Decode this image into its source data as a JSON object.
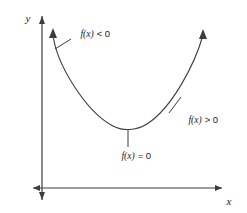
{
  "figure": {
    "background_color": "#ffffff",
    "stroke_color": "#3d3d3d",
    "text_color": "#1a1a1a"
  },
  "axes": {
    "y_axis_label": "y",
    "x_axis_label": "x",
    "x_axis": {
      "x1": 33,
      "x2": 222,
      "y": 188,
      "arrow_start": true,
      "arrow_end": true
    },
    "y_axis": {
      "x": 42,
      "y1": 16,
      "y2": 200,
      "arrow_start": true,
      "arrow_end": true
    }
  },
  "curve": {
    "name": "parabola",
    "arrow_left_tip": {
      "x": 53,
      "y": 30
    },
    "arrow_right_tip": {
      "x": 203,
      "y": 31
    },
    "vertex": {
      "x": 128,
      "y": 129
    },
    "path": "M 53 34 C 56 64, 86 112, 113 126 C 122 131, 136 131, 147 124 C 172 108, 195 64, 203 35"
  },
  "annotations": [
    {
      "id": "negative-region",
      "label_fn": "f(x)",
      "label_rel": "< 0",
      "label_x": 62,
      "label_y": 37,
      "leader": {
        "x1": 55,
        "y1": 49,
        "x2": 71,
        "y2": 39
      }
    },
    {
      "id": "positive-region",
      "label_fn": "f(x)",
      "label_rel": "> 0",
      "label_x": 170,
      "label_y": 123,
      "leader": {
        "x1": 181,
        "y1": 97,
        "x2": 169,
        "y2": 113
      }
    },
    {
      "id": "zero-point",
      "label_fn": "f(x)",
      "label_rel": "= 0",
      "label_x": 103,
      "label_y": 159,
      "leader": {
        "x1": 128,
        "y1": 130,
        "x2": 128,
        "y2": 147
      }
    }
  ]
}
